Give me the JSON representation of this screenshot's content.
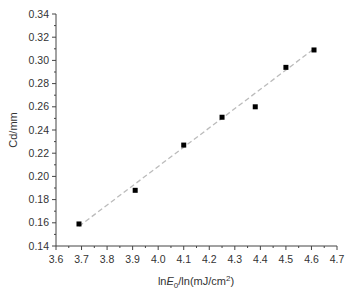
{
  "chart_data": {
    "type": "scatter",
    "title": "",
    "xlabel": "lnE0/ln(mJ/cm2)",
    "xlabel_parts": {
      "prefix": "ln",
      "var": "E",
      "sub": "0",
      "mid": "/ln(mJ/cm",
      "sup": "2",
      "suffix": ")"
    },
    "ylabel": "Cd/mm",
    "xlim": [
      3.6,
      4.7
    ],
    "ylim": [
      0.14,
      0.34
    ],
    "xticks": [
      "3.6",
      "3.7",
      "3.8",
      "3.9",
      "4.0",
      "4.1",
      "4.2",
      "4.3",
      "4.4",
      "4.5",
      "4.6",
      "4.7"
    ],
    "yticks": [
      "0.14",
      "0.16",
      "0.18",
      "0.20",
      "0.22",
      "0.24",
      "0.26",
      "0.28",
      "0.30",
      "0.32",
      "0.34"
    ],
    "grid": false,
    "legend": null,
    "series": [
      {
        "name": "data",
        "marker": "square",
        "color": "#000000",
        "x": [
          3.69,
          3.91,
          4.1,
          4.25,
          4.38,
          4.5,
          4.61
        ],
        "y": [
          0.159,
          0.188,
          0.227,
          0.251,
          0.26,
          0.294,
          0.309
        ]
      },
      {
        "name": "linear fit",
        "style": "dashed",
        "color": "#bbbbbb",
        "x": [
          3.69,
          4.61
        ],
        "y": [
          0.157,
          0.31
        ]
      }
    ]
  }
}
